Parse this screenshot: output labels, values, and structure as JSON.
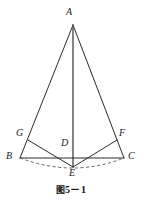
{
  "figure": {
    "caption_cjk": "图",
    "caption_number": "5－1",
    "caption_full": "图 5－1",
    "type": "euclidean-geometry-diagram",
    "canvas": {
      "width": 142,
      "height": 205
    },
    "colors": {
      "stroke": "#2b2b2b",
      "dashed_stroke": "#4a4a4a",
      "label_text": "#1b1b1b",
      "caption_text": "#141414",
      "background": "#ffffff"
    },
    "points": [
      {
        "id": "A",
        "label": "A",
        "x": 73,
        "y": 25,
        "label_x": 69,
        "label_y": 9
      },
      {
        "id": "B",
        "label": "B",
        "x": 20,
        "y": 158,
        "label_x": 8,
        "label_y": 154
      },
      {
        "id": "C",
        "label": "C",
        "x": 124,
        "y": 158,
        "label_x": 128,
        "label_y": 154
      },
      {
        "id": "D",
        "label": "D",
        "x": 73,
        "y": 158,
        "label_x": 62,
        "label_y": 139
      },
      {
        "id": "E",
        "label": "E",
        "x": 73,
        "y": 167,
        "label_x": 70,
        "label_y": 169
      },
      {
        "id": "F",
        "label": "F",
        "x": 117,
        "y": 140,
        "label_x": 120,
        "label_y": 130
      },
      {
        "id": "G",
        "label": "G",
        "x": 28,
        "y": 140,
        "label_x": 17,
        "label_y": 130
      }
    ],
    "segments": [
      {
        "id": "AB",
        "from": "A",
        "to": "B",
        "style": "solid"
      },
      {
        "id": "AC",
        "from": "A",
        "to": "C",
        "style": "solid"
      },
      {
        "id": "AE",
        "from": "A",
        "to": "E",
        "style": "solid"
      },
      {
        "id": "BC",
        "from": "B",
        "to": "C",
        "style": "solid"
      },
      {
        "id": "GE",
        "from": "G",
        "to": "E",
        "style": "solid"
      },
      {
        "id": "FE",
        "from": "F",
        "to": "E",
        "style": "solid"
      },
      {
        "id": "GB",
        "from": "G",
        "to": "B",
        "style": "solid"
      },
      {
        "id": "FC",
        "from": "F",
        "to": "C",
        "style": "solid"
      }
    ],
    "arcs": [
      {
        "id": "arc-BEC",
        "from": "B",
        "through": "E",
        "to": "C",
        "style": "dashed"
      }
    ]
  }
}
